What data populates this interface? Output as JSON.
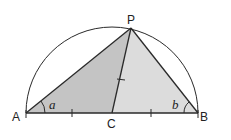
{
  "diagram": {
    "points": {
      "A": {
        "label": "A",
        "x": 26,
        "y": 113
      },
      "B": {
        "label": "B",
        "x": 198,
        "y": 113
      },
      "C": {
        "label": "C",
        "x": 112,
        "y": 113
      },
      "P": {
        "label": "P",
        "x": 131,
        "y": 28
      }
    },
    "angles": {
      "a": {
        "label": "a",
        "vertex": "A"
      },
      "b": {
        "label": "b",
        "vertex": "B"
      }
    },
    "colors": {
      "left_fill": "#c4c4c4",
      "right_fill": "#dcdcdc",
      "stroke": "#2a2a2a"
    }
  }
}
